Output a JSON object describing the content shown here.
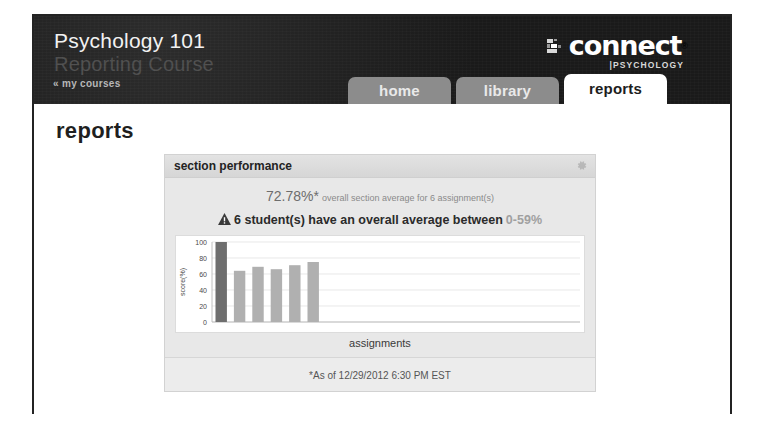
{
  "header": {
    "course_title": "Psychology 101",
    "course_subtitle": "Reporting Course",
    "my_courses_link": "« my courses",
    "brand": {
      "wordmark": "connect",
      "trademark": "®",
      "discipline": "|PSYCHOLOGY",
      "mark_icon": "connect-blocks-icon"
    }
  },
  "tabs": [
    {
      "label": "home",
      "active": false
    },
    {
      "label": "library",
      "active": false
    },
    {
      "label": "reports",
      "active": true
    }
  ],
  "page": {
    "heading": "reports"
  },
  "panel": {
    "title": "section performance",
    "gear_icon": "gear-icon",
    "summary": {
      "percent": "72.78%*",
      "description": "overall section average for 6 assignment(s)"
    },
    "alert": {
      "icon": "warning-triangle-icon",
      "text": "6 student(s) have an overall average between",
      "range": "0-59%"
    },
    "footer_note": "*As of 12/29/2012 6:30 PM EST"
  },
  "chart_data": {
    "type": "bar",
    "title": "",
    "xlabel": "assignments",
    "ylabel": "score(%)",
    "categories": [
      "1",
      "2",
      "3",
      "4",
      "5",
      "6"
    ],
    "values": [
      100,
      64,
      69,
      66,
      71,
      75
    ],
    "bar_colors": [
      "#6e6e6e",
      "#b0b0b0",
      "#b0b0b0",
      "#b0b0b0",
      "#b0b0b0",
      "#b0b0b0"
    ],
    "ylim": [
      0,
      100
    ],
    "yticks": [
      0,
      20,
      40,
      60,
      80,
      100
    ],
    "ytick_labels": [
      "0",
      "20",
      "40",
      "60",
      "80",
      "100"
    ],
    "grid": true,
    "legend": false,
    "plot_background": "#ffffff",
    "gridline_color": "#dedede"
  },
  "colors": {
    "header_background": "#1d1d1d",
    "tab_inactive": "#8c8c8c",
    "tab_active": "#ffffff",
    "panel_background": "#e8e8e8",
    "bar_highlight": "#6e6e6e",
    "bar_default": "#b0b0b0"
  }
}
